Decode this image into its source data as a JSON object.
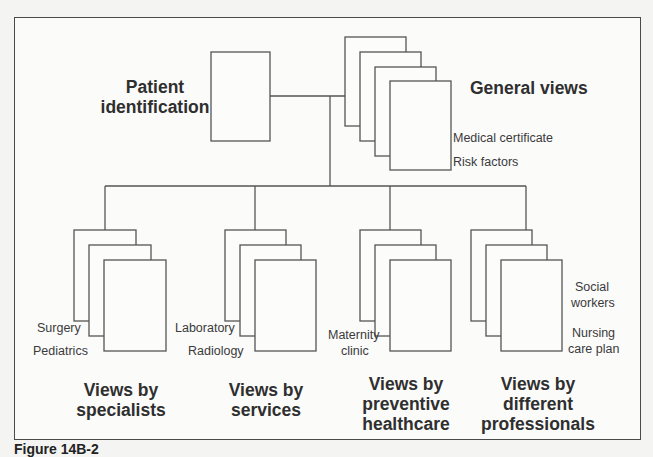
{
  "diagram": {
    "root": {
      "label": "Patient identification"
    },
    "general": {
      "label": "General views",
      "items": [
        "Medical certificate",
        "Risk factors"
      ]
    },
    "groups": [
      {
        "label_lines": [
          "Views by",
          "specialists"
        ],
        "items": [
          "Surgery",
          "Pediatrics"
        ]
      },
      {
        "label_lines": [
          "Views by",
          "services"
        ],
        "items": [
          "Laboratory",
          "Radiology"
        ]
      },
      {
        "label_lines": [
          "Views by",
          "preventive",
          "healthcare"
        ],
        "items": [
          "Maternity",
          "clinic"
        ]
      },
      {
        "label_lines": [
          "Views by",
          "different",
          "professionals"
        ],
        "items": [
          "Social",
          "workers",
          "Nursing",
          "care plan"
        ]
      }
    ]
  },
  "caption": "Figure 14B-2"
}
